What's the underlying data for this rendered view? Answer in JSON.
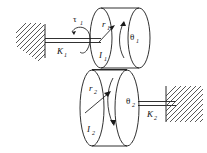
{
  "figure": {
    "background_color": "#ffffff",
    "line_color": "#1a1a1a",
    "hatch_color": "#3a3a3a"
  },
  "labels": {
    "torque": {
      "symbol": "τ",
      "subscript": "1",
      "name": "applied-torque"
    },
    "spring_left": {
      "symbol": "K",
      "subscript": "1",
      "name": "left-torsional-spring"
    },
    "spring_right": {
      "symbol": "K",
      "subscript": "2",
      "name": "right-torsional-spring"
    },
    "radius_upper": {
      "symbol": "r",
      "subscript": "1",
      "name": "upper-disk-radius"
    },
    "radius_lower": {
      "symbol": "r",
      "subscript": "2",
      "name": "lower-disk-radius"
    },
    "inertia_upper": {
      "symbol": "I",
      "subscript": "1",
      "name": "upper-disk-inertia"
    },
    "inertia_lower": {
      "symbol": "I",
      "subscript": "2",
      "name": "lower-disk-inertia"
    },
    "angle_upper": {
      "symbol": "θ",
      "subscript": "1",
      "name": "upper-disk-rotation"
    },
    "angle_lower": {
      "symbol": "θ",
      "subscript": "2",
      "name": "lower-disk-rotation"
    }
  },
  "components": {
    "upper_disk": {
      "name": "upper-cylinder",
      "description": "Cylinder with inertia I1 and radius r1"
    },
    "lower_disk": {
      "name": "lower-cylinder",
      "description": "Cylinder with inertia I2 and radius r2"
    },
    "left_wall": {
      "name": "left-fixed-support",
      "description": "Hatched fixed ground on the left"
    },
    "right_wall": {
      "name": "right-fixed-support",
      "description": "Hatched fixed ground on the right"
    },
    "left_shaft": {
      "name": "left-shaft",
      "description": "Horizontal shaft from left wall to upper disk"
    },
    "right_shaft": {
      "name": "right-shaft",
      "description": "Horizontal shaft from lower disk to right wall"
    },
    "contact_line": {
      "name": "disk-contact-line",
      "description": "Tangent contact between the two disks"
    }
  }
}
